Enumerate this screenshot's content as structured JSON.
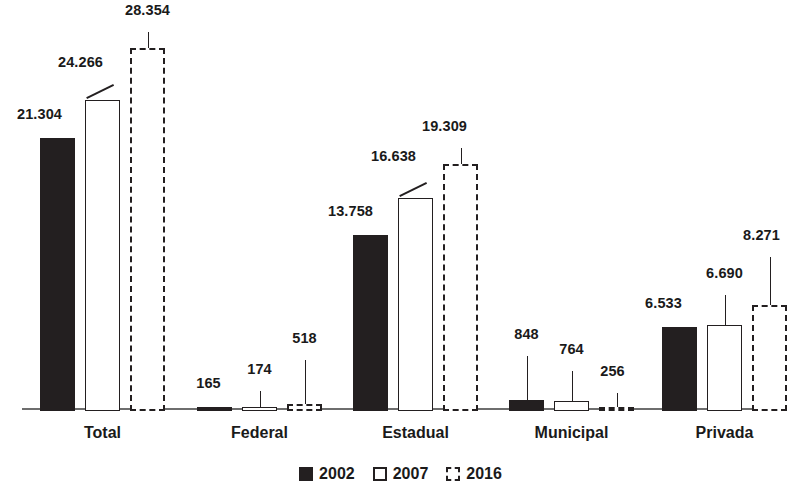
{
  "chart_data": {
    "type": "bar",
    "title": "",
    "subtitle": "",
    "xlabel": "",
    "ylabel": "",
    "grid": false,
    "legend_position": "bottom",
    "categories": [
      "Total",
      "Federal",
      "Estadual",
      "Municipal",
      "Privada"
    ],
    "series": [
      {
        "name": "2002",
        "style": "filled-black",
        "color": "#231f20",
        "values": [
          21304,
          165,
          13758,
          848,
          6533
        ],
        "labels": [
          "21.304",
          "165",
          "13.758",
          "848",
          "6.533"
        ]
      },
      {
        "name": "2007",
        "style": "white-outline",
        "color": "#ffffff",
        "border_color": "#231f20",
        "values": [
          24266,
          174,
          16638,
          764,
          6690
        ],
        "labels": [
          "24.266",
          "174",
          "16.638",
          "764",
          "6.690"
        ]
      },
      {
        "name": "2016",
        "style": "dashed-outline",
        "color": "#ffffff",
        "border_color": "#231f20",
        "values": [
          28354,
          518,
          19309,
          256,
          8271
        ],
        "labels": [
          "28.354",
          "518",
          "19.309",
          "256",
          "8.271"
        ]
      }
    ],
    "ylim": [
      0,
      28354
    ]
  },
  "legend": {
    "items": [
      {
        "label": "2002",
        "swatch": "filled-square-icon"
      },
      {
        "label": "2007",
        "swatch": "outline-square-icon"
      },
      {
        "label": "2016",
        "swatch": "dashed-square-icon"
      }
    ]
  },
  "axis": {
    "baseline_color": "#6e6e6e"
  }
}
